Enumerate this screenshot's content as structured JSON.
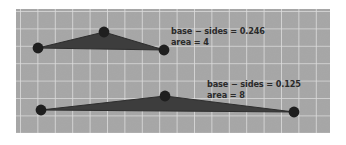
{
  "figure": {
    "title": "",
    "panel": {
      "background_color": "#a8a8a8",
      "grid_line_color": "#e3e3e3",
      "grid_spacing_px": 17.4,
      "x": 16,
      "y": 9,
      "width": 314,
      "height": 124
    },
    "shape_color": "#3b3b3b",
    "vertex_color": "#262626",
    "text_color": "#2b2b2b"
  },
  "shapes": [
    {
      "name": "triangle-upper",
      "vertices": [
        {
          "label": "left-vertex",
          "x": 38,
          "y": 48
        },
        {
          "label": "apex-vertex",
          "x": 104,
          "y": 32
        },
        {
          "label": "right-vertex",
          "x": 164,
          "y": 50
        }
      ],
      "annotation": {
        "line1": "base − sides = 0.246",
        "line2": "area = 4",
        "base_minus_sides": 0.246,
        "area": 4
      }
    },
    {
      "name": "triangle-lower",
      "vertices": [
        {
          "label": "left-vertex",
          "x": 41,
          "y": 110
        },
        {
          "label": "apex-vertex",
          "x": 165,
          "y": 96
        },
        {
          "label": "right-vertex",
          "x": 294,
          "y": 112
        }
      ],
      "annotation": {
        "line1": "base − sides = 0.125",
        "line2": "area = 8",
        "base_minus_sides": 0.125,
        "area": 8
      }
    }
  ],
  "annotations": {
    "upper": {
      "line1": "base − sides = 0.246",
      "line2": "area = 4"
    },
    "lower": {
      "line1": "base − sides = 0.125",
      "line2": "area = 8"
    }
  }
}
